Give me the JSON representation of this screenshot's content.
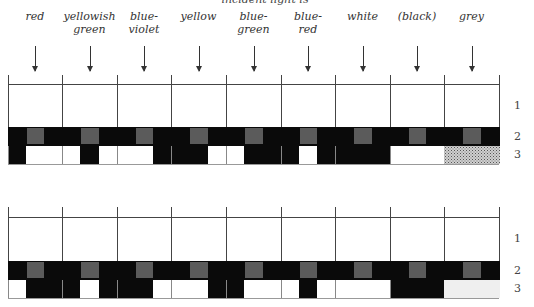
{
  "caption": "incident light is",
  "columns": [
    {
      "label": "red"
    },
    {
      "label": "yellowish green"
    },
    {
      "label": "blue-violet"
    },
    {
      "label": "yellow"
    },
    {
      "label": "blue-green"
    },
    {
      "label": "blue-red"
    },
    {
      "label": "white"
    },
    {
      "label": "(black)"
    },
    {
      "label": "grey"
    }
  ],
  "column_labels_display": [
    [
      "red"
    ],
    [
      "yellowish",
      "green"
    ],
    [
      "blue-",
      "violet"
    ],
    [
      "yellow"
    ],
    [
      "blue-",
      "green"
    ],
    [
      "blue-",
      "red"
    ],
    [
      "white"
    ],
    [
      "(black)"
    ],
    [
      "grey"
    ]
  ],
  "row_labels": [
    "1",
    "2",
    "3"
  ],
  "colors": {
    "black": "#0a0a0a",
    "grey_square": "#5b5b5b",
    "white": "#ffffff",
    "line": "#444444"
  },
  "figures": [
    {
      "name": "top",
      "row3_pattern": [
        [
          "black",
          "white",
          "white"
        ],
        [
          "white",
          "black",
          "white"
        ],
        [
          "white",
          "white",
          "black"
        ],
        [
          "black",
          "black",
          "white"
        ],
        [
          "white",
          "black",
          "black"
        ],
        [
          "black",
          "white",
          "black"
        ],
        [
          "black",
          "black",
          "black"
        ],
        [
          "white",
          "white",
          "white"
        ],
        [
          "stipple-dark"
        ]
      ]
    },
    {
      "name": "bottom",
      "row3_pattern": [
        [
          "white",
          "black",
          "black"
        ],
        [
          "black",
          "white",
          "black"
        ],
        [
          "black",
          "black",
          "white"
        ],
        [
          "white",
          "white",
          "black"
        ],
        [
          "black",
          "white",
          "white"
        ],
        [
          "white",
          "black",
          "white"
        ],
        [
          "white",
          "white",
          "white"
        ],
        [
          "black",
          "black",
          "black"
        ],
        [
          "stipple-light"
        ]
      ]
    }
  ]
}
